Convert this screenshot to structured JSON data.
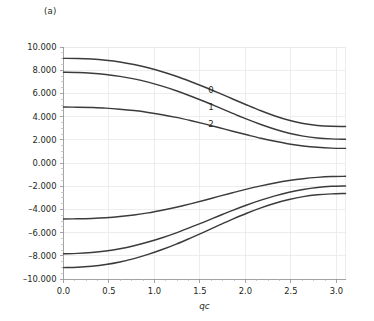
{
  "figure": {
    "panel_label": "(a)",
    "background_color": "#ffffff",
    "curve_color": "#3b3b3b",
    "grid_color": "#e8e8ea",
    "axis_color": "#9a9a9c",
    "text_color": "#231f20"
  },
  "chart_data": {
    "type": "line",
    "title": "(a)",
    "xlabel": "qc",
    "ylabel": "",
    "xlim": [
      0.0,
      3.1
    ],
    "ylim": [
      -10.0,
      10.0
    ],
    "grid": true,
    "legend": "inline-curve-labels",
    "xticks": [
      0.0,
      0.5,
      1.0,
      1.5,
      2.0,
      2.5,
      3.0
    ],
    "xtick_labels": [
      "0.0",
      "0.5",
      "1.0",
      "1.5",
      "2.0",
      "2.5",
      "3.0"
    ],
    "yticks": [
      -10.0,
      -8.0,
      -6.0,
      -4.0,
      -2.0,
      0.0,
      2.0,
      4.0,
      6.0,
      8.0,
      10.0
    ],
    "ytick_labels": [
      "-10.000",
      "-8.000",
      "-6.000",
      "-4.000",
      "-2.000",
      "0.000",
      "2.000",
      "4.000",
      "6.000",
      "8.000",
      "10.000"
    ],
    "annotations": [
      {
        "text": "0",
        "x": 1.62,
        "y": 6.05
      },
      {
        "text": "1",
        "x": 1.62,
        "y": 4.55
      },
      {
        "text": "2",
        "x": 1.62,
        "y": 3.12
      }
    ],
    "x": [
      0.0,
      0.155,
      0.31,
      0.465,
      0.62,
      0.775,
      0.93,
      1.085,
      1.24,
      1.395,
      1.55,
      1.705,
      1.86,
      2.015,
      2.17,
      2.325,
      2.48,
      2.635,
      2.79,
      2.945,
      3.1
    ],
    "series": [
      {
        "name": "0",
        "label": "0",
        "values": [
          9.02,
          9.01,
          8.96,
          8.86,
          8.71,
          8.49,
          8.21,
          7.87,
          7.48,
          7.03,
          6.55,
          6.04,
          5.52,
          5.0,
          4.5,
          4.05,
          3.68,
          3.41,
          3.24,
          3.16,
          3.15
        ]
      },
      {
        "name": "1",
        "label": "1",
        "values": [
          7.82,
          7.8,
          7.74,
          7.63,
          7.47,
          7.25,
          6.97,
          6.63,
          6.23,
          5.78,
          5.3,
          4.79,
          4.28,
          3.78,
          3.32,
          2.91,
          2.57,
          2.32,
          2.16,
          2.08,
          2.05
        ]
      },
      {
        "name": "2",
        "label": "2",
        "values": [
          4.82,
          4.81,
          4.78,
          4.73,
          4.64,
          4.52,
          4.36,
          4.16,
          3.93,
          3.66,
          3.37,
          3.06,
          2.74,
          2.43,
          2.13,
          1.87,
          1.64,
          1.47,
          1.35,
          1.28,
          1.26
        ]
      },
      {
        "name": "3",
        "label": "",
        "values": [
          -4.82,
          -4.81,
          -4.78,
          -4.72,
          -4.62,
          -4.48,
          -4.3,
          -4.07,
          -3.81,
          -3.52,
          -3.21,
          -2.88,
          -2.56,
          -2.25,
          -1.97,
          -1.72,
          -1.51,
          -1.35,
          -1.24,
          -1.17,
          -1.15
        ]
      },
      {
        "name": "4",
        "label": "",
        "values": [
          -7.82,
          -7.79,
          -7.71,
          -7.58,
          -7.39,
          -7.13,
          -6.81,
          -6.44,
          -6.02,
          -5.55,
          -5.07,
          -4.57,
          -4.08,
          -3.62,
          -3.2,
          -2.83,
          -2.52,
          -2.28,
          -2.11,
          -2.01,
          -1.98
        ]
      },
      {
        "name": "5",
        "label": "",
        "values": [
          -9.02,
          -8.99,
          -8.9,
          -8.75,
          -8.53,
          -8.24,
          -7.88,
          -7.46,
          -6.99,
          -6.47,
          -5.93,
          -5.38,
          -4.84,
          -4.33,
          -3.87,
          -3.47,
          -3.15,
          -2.9,
          -2.74,
          -2.66,
          -2.63
        ]
      }
    ]
  }
}
